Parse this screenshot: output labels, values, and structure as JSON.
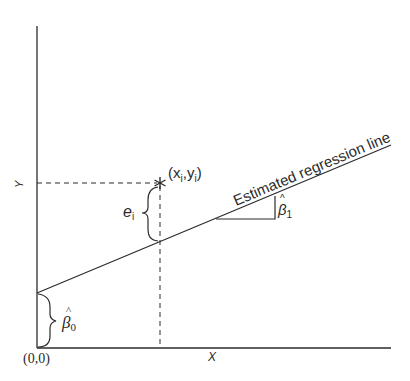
{
  "diagram": {
    "colors": {
      "ink": "#2b2b2b",
      "background": "#ffffff"
    },
    "axes": {
      "x_label": "X",
      "y_label": "Y",
      "origin_label": "(0,0)"
    },
    "regression_line": {
      "label": "Estimated regression line"
    },
    "point": {
      "marker": "*",
      "label_open": "(x",
      "label_sub_x": "i",
      "label_mid": ",y",
      "label_sub_y": "i",
      "label_close": ")"
    },
    "residual": {
      "label": "e",
      "label_sub": "i"
    },
    "slope": {
      "label": "β",
      "hat": "^",
      "label_sub": "1"
    },
    "intercept": {
      "label": "β",
      "hat": "^",
      "label_sub": "0"
    }
  }
}
